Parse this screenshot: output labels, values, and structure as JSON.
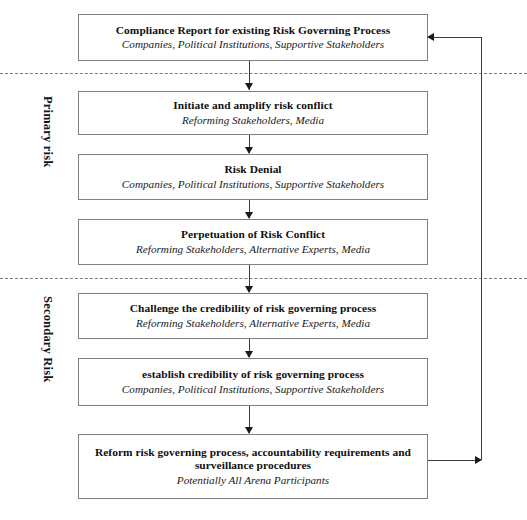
{
  "diagram": {
    "phases": [
      {
        "id": "primary",
        "label": "Primary risk"
      },
      {
        "id": "secondary",
        "label": "Secondary Risk"
      }
    ],
    "nodes": [
      {
        "id": "compliance-report",
        "title": "Compliance Report for existing Risk Governing Process",
        "actors": "Companies, Political Institutions, Supportive Stakeholders"
      },
      {
        "id": "initiate-amplify",
        "title": "Initiate and amplify risk conflict",
        "actors": "Reforming Stakeholders, Media"
      },
      {
        "id": "risk-denial",
        "title": "Risk Denial",
        "actors": "Companies, Political Institutions, Supportive Stakeholders"
      },
      {
        "id": "perpetuation",
        "title": "Perpetuation of Risk Conflict",
        "actors": "Reforming Stakeholders, Alternative Experts, Media"
      },
      {
        "id": "challenge-credibility",
        "title": "Challenge the credibility of risk governing process",
        "actors": "Reforming Stakeholders, Alternative Experts, Media"
      },
      {
        "id": "establish-credibility",
        "title": "establish credibility of risk governing process",
        "actors": "Companies, Political Institutions, Supportive Stakeholders"
      },
      {
        "id": "reform-process",
        "title": "Reform risk governing process, accountability requirements and surveillance procedures",
        "actors": "Potentially All Arena Participants"
      }
    ],
    "colors": {
      "box_border": "#808080",
      "connector": "#3a3a3a",
      "divider": "#7a7a7a",
      "background": "#ffffff",
      "text": "#101010"
    }
  }
}
